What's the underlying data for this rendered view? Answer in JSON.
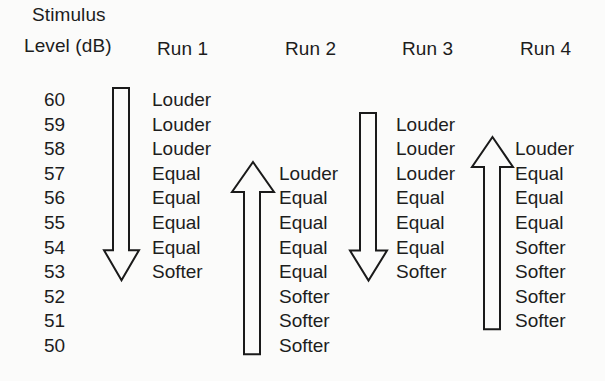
{
  "figure": {
    "axis_title_line1": "Stimulus",
    "axis_title_line2": "Level (dB)",
    "levels": [
      60,
      59,
      58,
      57,
      56,
      55,
      54,
      53,
      52,
      51,
      50
    ]
  },
  "runs": [
    {
      "header": "Run 1",
      "direction": "down",
      "responses": [
        {
          "level": 60,
          "label": "Louder"
        },
        {
          "level": 59,
          "label": "Louder"
        },
        {
          "level": 58,
          "label": "Louder"
        },
        {
          "level": 57,
          "label": "Equal"
        },
        {
          "level": 56,
          "label": "Equal"
        },
        {
          "level": 55,
          "label": "Equal"
        },
        {
          "level": 54,
          "label": "Equal"
        },
        {
          "level": 53,
          "label": "Softer"
        }
      ]
    },
    {
      "header": "Run 2",
      "direction": "up",
      "responses": [
        {
          "level": 57,
          "label": "Louder"
        },
        {
          "level": 56,
          "label": "Equal"
        },
        {
          "level": 55,
          "label": "Equal"
        },
        {
          "level": 54,
          "label": "Equal"
        },
        {
          "level": 53,
          "label": "Equal"
        },
        {
          "level": 52,
          "label": "Softer"
        },
        {
          "level": 51,
          "label": "Softer"
        },
        {
          "level": 50,
          "label": "Softer"
        }
      ]
    },
    {
      "header": "Run 3",
      "direction": "down",
      "responses": [
        {
          "level": 59,
          "label": "Louder"
        },
        {
          "level": 58,
          "label": "Louder"
        },
        {
          "level": 57,
          "label": "Louder"
        },
        {
          "level": 56,
          "label": "Equal"
        },
        {
          "level": 55,
          "label": "Equal"
        },
        {
          "level": 54,
          "label": "Equal"
        },
        {
          "level": 53,
          "label": "Softer"
        }
      ]
    },
    {
      "header": "Run 4",
      "direction": "up",
      "responses": [
        {
          "level": 58,
          "label": "Louder"
        },
        {
          "level": 57,
          "label": "Equal"
        },
        {
          "level": 56,
          "label": "Equal"
        },
        {
          "level": 55,
          "label": "Equal"
        },
        {
          "level": 54,
          "label": "Softer"
        },
        {
          "level": 53,
          "label": "Softer"
        },
        {
          "level": 52,
          "label": "Softer"
        },
        {
          "level": 51,
          "label": "Softer"
        }
      ]
    }
  ],
  "colors": {
    "background": "#fbfbfa",
    "ink": "#1a1a1a"
  }
}
